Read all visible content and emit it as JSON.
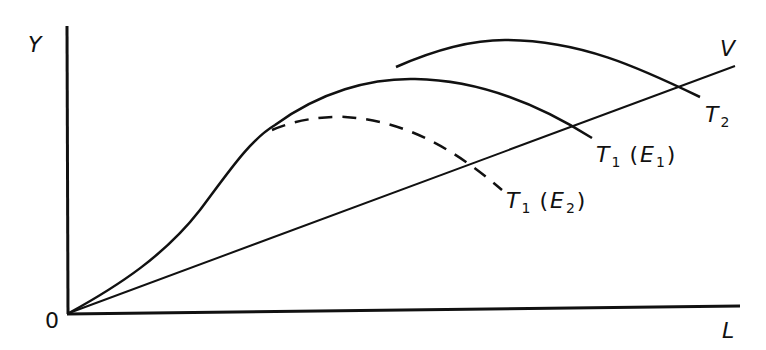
{
  "diagram": {
    "type": "economic-growth-diagram",
    "axes": {
      "y_label": "Y",
      "x_label": "L",
      "origin_label": "0"
    },
    "lines": {
      "v_label": "V",
      "t2": {
        "main": "T",
        "sub": "2"
      },
      "t1_e1": {
        "main": "T",
        "sub": "1",
        "arg_main": "E",
        "arg_sub": "1"
      },
      "t1_e2": {
        "main": "T",
        "sub": "1",
        "arg_main": "E",
        "arg_sub": "2"
      }
    },
    "styles": {
      "ink": "#111111",
      "background": "#ffffff"
    }
  }
}
